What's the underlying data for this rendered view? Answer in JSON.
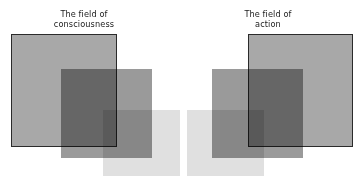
{
  "canvas": {
    "width": 363,
    "height": 187,
    "background": "#ffffff"
  },
  "labels": {
    "left": "The field of\nconsciousness",
    "right": "The field of\naction"
  },
  "colors": {
    "outline_stroke": "#2b2b2b",
    "outlined_fill": "#a8a8a8",
    "medium_fill": "#9a9a9a",
    "light_fill": "#e0e0e0",
    "background": "#ffffff"
  },
  "groups": [
    {
      "name": "field-of-consciousness",
      "label_key": "left",
      "shapes": [
        {
          "name": "outlined-square",
          "kind": "outlined",
          "x": 11,
          "y": 34,
          "width": 106,
          "height": 113,
          "fill": "#a8a8a8",
          "stroke": "#2b2b2b"
        },
        {
          "name": "medium-rect",
          "kind": "filled",
          "x": 61,
          "y": 69,
          "width": 91,
          "height": 89,
          "fill": "#9a9a9a",
          "stroke": "none"
        },
        {
          "name": "light-rect",
          "kind": "filled",
          "x": 103,
          "y": 110,
          "width": 77,
          "height": 66,
          "fill": "#e0e0e0",
          "stroke": "none"
        }
      ]
    },
    {
      "name": "field-of-action",
      "label_key": "right",
      "shapes": [
        {
          "name": "light-rect",
          "kind": "filled",
          "x": 187,
          "y": 110,
          "width": 77,
          "height": 66,
          "fill": "#e0e0e0",
          "stroke": "none"
        },
        {
          "name": "medium-rect",
          "kind": "filled",
          "x": 212,
          "y": 69,
          "width": 91,
          "height": 89,
          "fill": "#9a9a9a",
          "stroke": "none"
        },
        {
          "name": "outlined-square",
          "kind": "outlined",
          "x": 248,
          "y": 34,
          "width": 105,
          "height": 113,
          "fill": "#a8a8a8",
          "stroke": "#2b2b2b"
        }
      ]
    }
  ]
}
